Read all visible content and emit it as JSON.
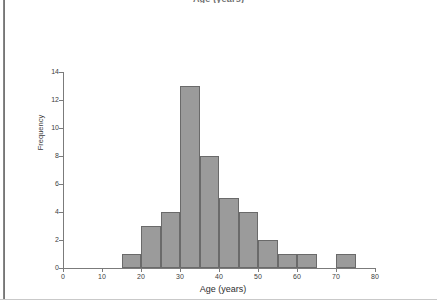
{
  "page": {
    "top_caption": "Age (years)"
  },
  "chart_data": {
    "type": "bar",
    "title": "Age (years)",
    "xlabel": "Age (years)",
    "ylabel": "Frequency",
    "xlim": [
      0,
      80
    ],
    "ylim": [
      0,
      14
    ],
    "grid": false,
    "legend": "none",
    "bin_width": 5,
    "bin_edges": [
      15,
      20,
      25,
      30,
      35,
      40,
      45,
      50,
      55,
      60,
      65,
      70,
      75
    ],
    "categories": [
      "15-20",
      "20-25",
      "25-30",
      "30-35",
      "35-40",
      "40-45",
      "45-50",
      "50-55",
      "55-60",
      "60-65",
      "65-70",
      "70-75"
    ],
    "values": [
      1,
      3,
      4,
      13,
      8,
      5,
      4,
      2,
      1,
      1,
      0,
      1
    ],
    "x_ticks": [
      0,
      10,
      20,
      30,
      40,
      50,
      60,
      70,
      80
    ],
    "x_tick_labels": [
      "0",
      "10",
      "20",
      "30",
      "40",
      "50",
      "60",
      "70",
      "80"
    ],
    "y_ticks": [
      0,
      2,
      4,
      6,
      8,
      10,
      12,
      14
    ],
    "y_tick_labels": [
      "0",
      "2",
      "4",
      "6",
      "8",
      "10",
      "12",
      "14"
    ],
    "bar_color": "#9b9b9b",
    "bar_edge_color": "#6a6a6a",
    "axis_color": "#7b7b7b"
  }
}
